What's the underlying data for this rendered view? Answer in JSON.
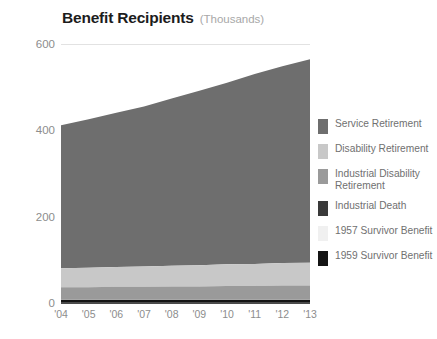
{
  "title": {
    "main": "Benefit Recipients",
    "units": "(Thousands)"
  },
  "chart_data": {
    "type": "area",
    "stacked": true,
    "title": "Benefit Recipients",
    "subtitle": "(Thousands)",
    "xlabel": "",
    "ylabel": "",
    "units": "Thousands",
    "x": [
      "'04",
      "'05",
      "'06",
      "'07",
      "'08",
      "'09",
      "'10",
      "'11",
      "'12",
      "'13"
    ],
    "ylim": [
      0,
      600
    ],
    "yticks": [
      0,
      200,
      400,
      600
    ],
    "ytick_labels": [
      "0",
      "200",
      "400",
      "600"
    ],
    "grid": true,
    "legend_position": "right",
    "series": [
      {
        "name": "Service Retirement",
        "color": "#6e6e6e",
        "values": [
          331,
          344,
          357,
          371,
          387,
          404,
          421,
          440,
          456,
          471
        ]
      },
      {
        "name": "Disability Retirement",
        "color": "#c8c8c8",
        "values": [
          44,
          45,
          46,
          47,
          48,
          49,
          50,
          51,
          52,
          53
        ]
      },
      {
        "name": "Industrial Disability Retirement",
        "color": "#9a9a9a",
        "values": [
          28,
          28,
          29,
          29,
          30,
          30,
          31,
          31,
          32,
          32
        ]
      },
      {
        "name": "Industrial Death",
        "color": "#3a3a3a",
        "values": [
          1,
          1,
          1,
          1,
          1,
          1,
          1,
          1,
          1,
          1
        ]
      },
      {
        "name": "1957 Survivor Benefit",
        "color": "#f0f0f0",
        "values": [
          0.5,
          0.5,
          0.5,
          0.5,
          0.5,
          0.5,
          0.5,
          0.5,
          0.5,
          0.5
        ]
      },
      {
        "name": "1959 Survivor Benefit",
        "color": "#141414",
        "values": [
          7,
          7,
          7,
          7,
          7,
          7,
          7,
          7,
          7,
          7
        ]
      }
    ],
    "totals": [
      411,
      425,
      440,
      455,
      473,
      491,
      510,
      530,
      548,
      564
    ]
  },
  "legend": {
    "items": [
      {
        "label": "Service Retirement",
        "color": "#6e6e6e"
      },
      {
        "label": "Disability Retirement",
        "color": "#c8c8c8"
      },
      {
        "label": "Industrial Disability Retirement",
        "color": "#9a9a9a"
      },
      {
        "label": "Industrial Death",
        "color": "#3a3a3a"
      },
      {
        "label": "1957 Survivor Benefit",
        "color": "#f0f0f0"
      },
      {
        "label": "1959 Survivor Benefit",
        "color": "#141414"
      }
    ]
  }
}
